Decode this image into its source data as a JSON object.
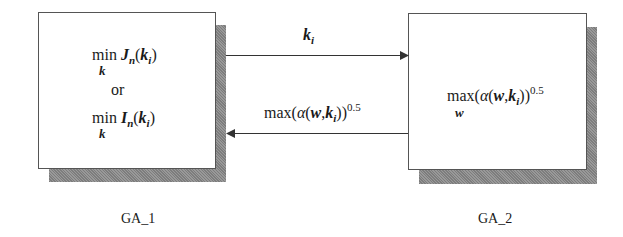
{
  "blocks": [
    {
      "id": "GA_1",
      "label": "GA_1",
      "expr1": {
        "op": "min",
        "sub": "k",
        "func": "J",
        "fsub": "n",
        "arg": "k",
        "argsub": "i"
      },
      "connector": "or",
      "expr2": {
        "op": "min",
        "sub": "k",
        "func": "I",
        "fsub": "n",
        "arg": "k",
        "argsub": "i"
      }
    },
    {
      "id": "GA_2",
      "label": "GA_2",
      "expr": {
        "op": "max",
        "sub": "w",
        "alpha": "α",
        "w": "w",
        "k": "k",
        "ksub": "i",
        "exp": "0.5"
      }
    }
  ],
  "arrows": [
    {
      "from": "GA_1",
      "to": "GA_2",
      "label_var": "k",
      "label_sub": "i"
    },
    {
      "from": "GA_2",
      "to": "GA_1",
      "label_op": "max",
      "alpha": "α",
      "w": "w",
      "k": "k",
      "ksub": "i",
      "exp": "0.5"
    }
  ]
}
